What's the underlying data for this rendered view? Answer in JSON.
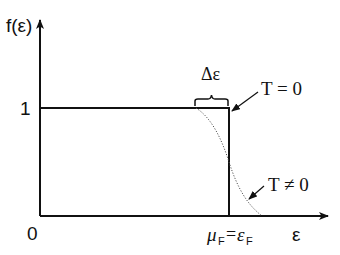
{
  "diagram": {
    "y_axis_label": "f(ε)",
    "x_axis_label": "ε",
    "origin_label": "0",
    "y_tick_label": "1",
    "fermi_label": {
      "mu": "μ",
      "mu_sub": "F",
      "equals": "=",
      "eps": "ε",
      "eps_sub": "F"
    },
    "width_label": "Δε",
    "curves": [
      {
        "name": "T = 0",
        "style": "solid step",
        "label": "T = 0"
      },
      {
        "name": "T ≠ 0",
        "style": "dotted smooth",
        "label": "T ≠ 0"
      }
    ],
    "colors": {
      "ink": "#111111",
      "background": "#ffffff"
    }
  }
}
